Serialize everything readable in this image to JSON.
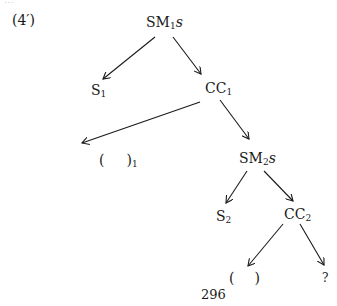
{
  "diagram": {
    "example_label": "(4′)",
    "page_number": "296",
    "nodes": {
      "root": {
        "main": "SM",
        "sub": "1",
        "suffix": "s"
      },
      "s1": {
        "main": "S",
        "sub": "1"
      },
      "cc1": {
        "main": "CC",
        "sub": "1"
      },
      "gap1": {
        "open": "(",
        "close": ")",
        "sub": "1"
      },
      "sm2": {
        "main": "SM",
        "sub": "2",
        "suffix": "s"
      },
      "s2": {
        "main": "S",
        "sub": "2"
      },
      "cc2": {
        "main": "CC",
        "sub": "2"
      },
      "gap2": {
        "open": "(",
        "close": ")"
      },
      "unknown": {
        "main": "?"
      }
    },
    "edges": [
      [
        "root",
        "s1"
      ],
      [
        "root",
        "cc1"
      ],
      [
        "cc1",
        "gap1"
      ],
      [
        "cc1",
        "sm2"
      ],
      [
        "sm2",
        "s2"
      ],
      [
        "sm2",
        "cc2"
      ],
      [
        "cc2",
        "gap2"
      ],
      [
        "cc2",
        "unknown"
      ]
    ]
  }
}
